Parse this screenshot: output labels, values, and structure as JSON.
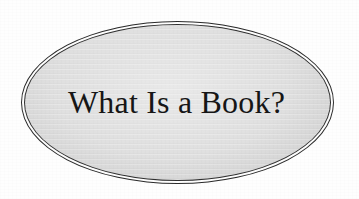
{
  "page": {
    "background_color": "#fdfdfd",
    "width": 359,
    "height": 199
  },
  "badge": {
    "shape": "ellipse",
    "fill_color": "#dcdcdc",
    "border_color": "#2b2b2b",
    "border_style": "double-line",
    "title": "What Is a Book?",
    "title_color": "#161616"
  }
}
